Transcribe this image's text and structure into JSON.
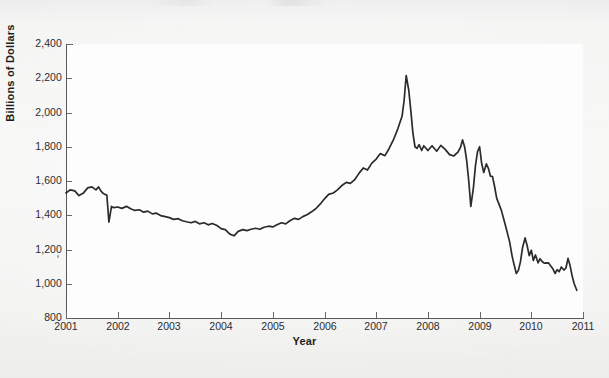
{
  "chart_data": {
    "type": "line",
    "title": "",
    "xlabel": "Year",
    "ylabel": "Billions of Dollars",
    "xlim": [
      2001,
      2011
    ],
    "ylim": [
      800,
      2400
    ],
    "grid": false,
    "legend": "none",
    "x_tick_labels": [
      "2001",
      "2002",
      "2003",
      "2004",
      "2005",
      "2006",
      "2007",
      "2008",
      "2009",
      "2010",
      "2011"
    ],
    "y_tick_labels": [
      "800",
      "1,000",
      "1,200",
      "1,400",
      "1,600",
      "1,800",
      "2,000",
      "2,200",
      "2,400"
    ],
    "y_tick_values": [
      800,
      1000,
      1200,
      1400,
      1600,
      1800,
      2000,
      2200,
      2400
    ],
    "series": [
      {
        "name": "Total",
        "color": "#2b2b2d",
        "points": [
          [
            2001.0,
            1530
          ],
          [
            2001.08,
            1548
          ],
          [
            2001.17,
            1542
          ],
          [
            2001.25,
            1515
          ],
          [
            2001.33,
            1528
          ],
          [
            2001.42,
            1560
          ],
          [
            2001.5,
            1566
          ],
          [
            2001.58,
            1548
          ],
          [
            2001.63,
            1566
          ],
          [
            2001.67,
            1544
          ],
          [
            2001.71,
            1530
          ],
          [
            2001.75,
            1522
          ],
          [
            2001.79,
            1518
          ],
          [
            2001.83,
            1360
          ],
          [
            2001.88,
            1452
          ],
          [
            2001.92,
            1444
          ],
          [
            2002.0,
            1448
          ],
          [
            2002.08,
            1440
          ],
          [
            2002.17,
            1452
          ],
          [
            2002.25,
            1438
          ],
          [
            2002.33,
            1428
          ],
          [
            2002.42,
            1432
          ],
          [
            2002.5,
            1418
          ],
          [
            2002.58,
            1424
          ],
          [
            2002.67,
            1408
          ],
          [
            2002.75,
            1412
          ],
          [
            2002.83,
            1398
          ],
          [
            2002.92,
            1392
          ],
          [
            2003.0,
            1386
          ],
          [
            2003.08,
            1376
          ],
          [
            2003.17,
            1380
          ],
          [
            2003.25,
            1368
          ],
          [
            2003.33,
            1362
          ],
          [
            2003.42,
            1356
          ],
          [
            2003.5,
            1364
          ],
          [
            2003.58,
            1350
          ],
          [
            2003.67,
            1356
          ],
          [
            2003.75,
            1344
          ],
          [
            2003.83,
            1352
          ],
          [
            2003.92,
            1340
          ],
          [
            2004.0,
            1322
          ],
          [
            2004.08,
            1316
          ],
          [
            2004.17,
            1290
          ],
          [
            2004.25,
            1280
          ],
          [
            2004.33,
            1306
          ],
          [
            2004.42,
            1316
          ],
          [
            2004.5,
            1310
          ],
          [
            2004.58,
            1318
          ],
          [
            2004.67,
            1324
          ],
          [
            2004.75,
            1318
          ],
          [
            2004.83,
            1330
          ],
          [
            2004.92,
            1336
          ],
          [
            2005.0,
            1332
          ],
          [
            2005.08,
            1344
          ],
          [
            2005.17,
            1356
          ],
          [
            2005.25,
            1350
          ],
          [
            2005.33,
            1368
          ],
          [
            2005.42,
            1382
          ],
          [
            2005.5,
            1376
          ],
          [
            2005.58,
            1392
          ],
          [
            2005.67,
            1404
          ],
          [
            2005.75,
            1420
          ],
          [
            2005.83,
            1438
          ],
          [
            2005.92,
            1466
          ],
          [
            2006.0,
            1496
          ],
          [
            2006.08,
            1522
          ],
          [
            2006.17,
            1530
          ],
          [
            2006.25,
            1548
          ],
          [
            2006.33,
            1572
          ],
          [
            2006.42,
            1592
          ],
          [
            2006.5,
            1586
          ],
          [
            2006.58,
            1606
          ],
          [
            2006.67,
            1646
          ],
          [
            2006.75,
            1676
          ],
          [
            2006.83,
            1664
          ],
          [
            2006.92,
            1706
          ],
          [
            2007.0,
            1728
          ],
          [
            2007.08,
            1760
          ],
          [
            2007.17,
            1748
          ],
          [
            2007.25,
            1790
          ],
          [
            2007.33,
            1838
          ],
          [
            2007.42,
            1906
          ],
          [
            2007.5,
            1978
          ],
          [
            2007.54,
            2070
          ],
          [
            2007.58,
            2216
          ],
          [
            2007.63,
            2130
          ],
          [
            2007.67,
            2010
          ],
          [
            2007.71,
            1880
          ],
          [
            2007.75,
            1800
          ],
          [
            2007.79,
            1790
          ],
          [
            2007.83,
            1812
          ],
          [
            2007.88,
            1778
          ],
          [
            2007.92,
            1806
          ],
          [
            2008.0,
            1778
          ],
          [
            2008.08,
            1806
          ],
          [
            2008.17,
            1774
          ],
          [
            2008.25,
            1808
          ],
          [
            2008.33,
            1786
          ],
          [
            2008.42,
            1754
          ],
          [
            2008.5,
            1746
          ],
          [
            2008.58,
            1768
          ],
          [
            2008.63,
            1796
          ],
          [
            2008.67,
            1840
          ],
          [
            2008.71,
            1800
          ],
          [
            2008.75,
            1720
          ],
          [
            2008.79,
            1600
          ],
          [
            2008.83,
            1452
          ],
          [
            2008.88,
            1560
          ],
          [
            2008.92,
            1690
          ],
          [
            2008.96,
            1772
          ],
          [
            2009.0,
            1800
          ],
          [
            2009.04,
            1702
          ],
          [
            2009.08,
            1650
          ],
          [
            2009.13,
            1700
          ],
          [
            2009.17,
            1674
          ],
          [
            2009.21,
            1628
          ],
          [
            2009.25,
            1626
          ],
          [
            2009.29,
            1568
          ],
          [
            2009.33,
            1500
          ],
          [
            2009.42,
            1430
          ],
          [
            2009.5,
            1340
          ],
          [
            2009.58,
            1246
          ],
          [
            2009.63,
            1160
          ],
          [
            2009.67,
            1108
          ],
          [
            2009.71,
            1060
          ],
          [
            2009.75,
            1078
          ],
          [
            2009.79,
            1128
          ],
          [
            2009.83,
            1210
          ],
          [
            2009.88,
            1268
          ],
          [
            2009.92,
            1222
          ],
          [
            2009.96,
            1164
          ],
          [
            2010.0,
            1196
          ],
          [
            2010.04,
            1136
          ],
          [
            2010.08,
            1168
          ],
          [
            2010.13,
            1122
          ],
          [
            2010.17,
            1146
          ],
          [
            2010.21,
            1130
          ],
          [
            2010.25,
            1120
          ],
          [
            2010.33,
            1122
          ],
          [
            2010.42,
            1086
          ],
          [
            2010.46,
            1060
          ],
          [
            2010.5,
            1082
          ],
          [
            2010.54,
            1070
          ],
          [
            2010.58,
            1098
          ],
          [
            2010.63,
            1080
          ],
          [
            2010.67,
            1092
          ],
          [
            2010.71,
            1148
          ],
          [
            2010.75,
            1106
          ],
          [
            2010.79,
            1046
          ],
          [
            2010.83,
            1000
          ],
          [
            2010.88,
            962
          ]
        ]
      }
    ]
  }
}
